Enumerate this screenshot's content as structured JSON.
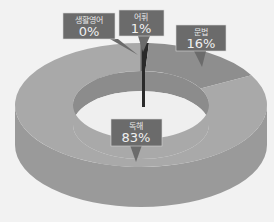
{
  "chart_data": {
    "type": "pie",
    "variant": "3d-donut",
    "title": "",
    "categories": [
      "생활영어",
      "어휘",
      "문법",
      "독해"
    ],
    "values": [
      0,
      1,
      16,
      83
    ],
    "labels": [
      "0%",
      "1%",
      "16%",
      "83%"
    ],
    "unit": "%",
    "colors": {
      "독해": "#a9a9a9",
      "문법": "#8e8e8e",
      "어휘": "#2a2a2a",
      "생활영어": "#7a7a7a",
      "side": "#9a9a9a",
      "inner": "#8c8c8c",
      "callout": "#6b6b6b"
    },
    "legend": "none"
  }
}
